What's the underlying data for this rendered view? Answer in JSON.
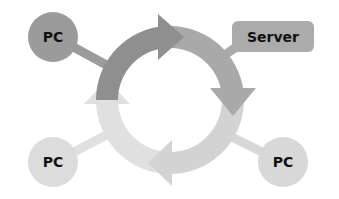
{
  "diagram": {
    "type": "cycle-network",
    "background": "#ffffff",
    "cycle": {
      "center": [
        170,
        100
      ],
      "outer_radius": 74,
      "inner_radius": 52,
      "direction": "clockwise",
      "segments": [
        {
          "id": "top-left",
          "color": "#8f8f8f"
        },
        {
          "id": "top-right",
          "color": "#a9a9a9"
        },
        {
          "id": "bottom-right",
          "color": "#d3d3d3"
        },
        {
          "id": "bottom-left",
          "color": "#e0e0e0"
        }
      ]
    },
    "nodes": [
      {
        "id": "pc-top-left",
        "label": "PC",
        "shape": "circle",
        "color": "#9b9b9b"
      },
      {
        "id": "server",
        "label": "Server",
        "shape": "rounded-rect",
        "color": "#ababab"
      },
      {
        "id": "pc-bottom-left",
        "label": "PC",
        "shape": "circle",
        "color": "#dcdcdc"
      },
      {
        "id": "pc-bottom-right",
        "label": "PC",
        "shape": "circle",
        "color": "#d8d8d8"
      }
    ]
  }
}
